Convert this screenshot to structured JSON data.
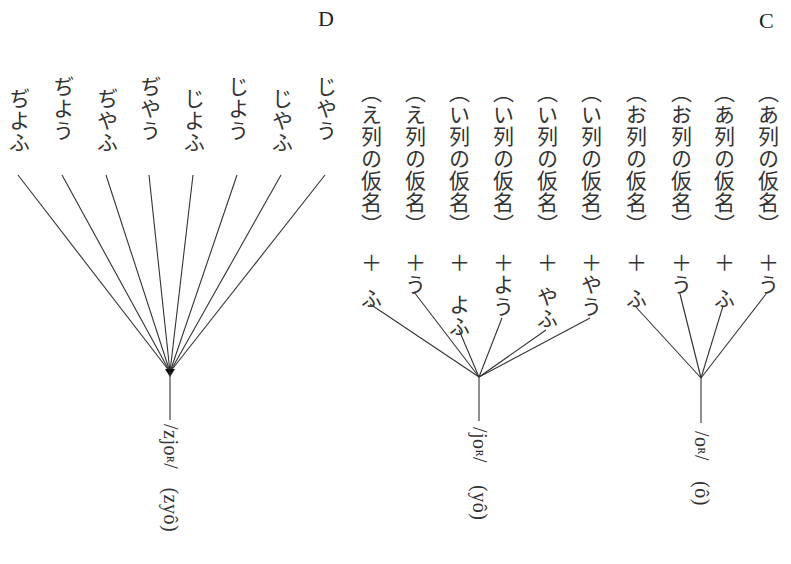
{
  "groups": {
    "D": {
      "letter": "D",
      "items": [
        {
          "text": "ぢよふ"
        },
        {
          "text": "ぢよう"
        },
        {
          "text": "ぢやふ"
        },
        {
          "text": "ぢやう"
        },
        {
          "text": "じよふ"
        },
        {
          "text": "じよう"
        },
        {
          "text": "じやふ"
        },
        {
          "text": "じやう"
        }
      ],
      "result_phon": "/zjo",
      "result_phon_sc": "ʀ",
      "result_phon_end": "/",
      "result_romaji": "(zyô)"
    },
    "B": {
      "items": [
        {
          "prefix": "︵え列の仮名︶",
          "plus": "＋",
          "suffix": "ふ"
        },
        {
          "prefix": "︵え列の仮名︶",
          "plus": "＋",
          "suffix": "う"
        },
        {
          "prefix": "︵い列の仮名︶",
          "plus": "＋",
          "suffix": "よふ"
        },
        {
          "prefix": "︵い列の仮名︶",
          "plus": "＋",
          "suffix": "よう"
        },
        {
          "prefix": "︵い列の仮名︶",
          "plus": "＋",
          "suffix": "やふ"
        },
        {
          "prefix": "︵い列の仮名︶",
          "plus": "＋",
          "suffix": "やう"
        }
      ],
      "result_phon": "/jo",
      "result_phon_sc": "ʀ",
      "result_phon_end": "/",
      "result_romaji": "(yô)"
    },
    "C": {
      "letter": "C",
      "items": [
        {
          "prefix": "︵お列の仮名︶",
          "plus": "＋",
          "suffix": "ふ"
        },
        {
          "prefix": "︵お列の仮名︶",
          "plus": "＋",
          "suffix": "う"
        },
        {
          "prefix": "︵あ列の仮名︶",
          "plus": "＋",
          "suffix": "ふ"
        },
        {
          "prefix": "︵あ列の仮名︶",
          "plus": "＋",
          "suffix": "う"
        }
      ],
      "result_phon": "/o",
      "result_phon_sc": "ʀ",
      "result_phon_end": "/",
      "result_romaji": "(ô)"
    }
  },
  "colors": {
    "line": "#333333",
    "text": "#222222",
    "background": "#ffffff"
  }
}
